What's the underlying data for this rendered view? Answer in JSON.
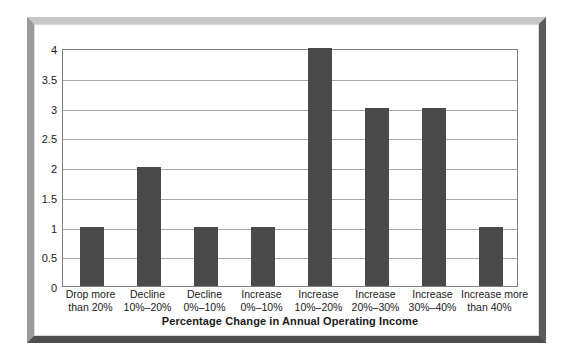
{
  "chart_data": {
    "type": "bar",
    "title": "",
    "xlabel": "Percentage Change in Annual Operating Income",
    "ylabel": "",
    "categories": [
      "Drop more than 20%",
      "Decline 10%–20%",
      "Decline 0%–10%",
      "Increase 0%–10%",
      "Increase 10%–20%",
      "Increase 20%–30%",
      "Increase 30%–40%",
      "Increase more than 40%"
    ],
    "category_lines": [
      [
        "Drop more",
        "than 20%"
      ],
      [
        "Decline",
        "10%–20%"
      ],
      [
        "Decline",
        "0%–10%"
      ],
      [
        "Increase",
        "0%–10%"
      ],
      [
        "Increase",
        "10%–20%"
      ],
      [
        "Increase",
        "20%–30%"
      ],
      [
        "Increase",
        "30%–40%"
      ],
      [
        "Increase more",
        "than 40%"
      ]
    ],
    "values": [
      1,
      2,
      1,
      1,
      4,
      3,
      3,
      1
    ],
    "ylim": [
      0,
      4
    ],
    "ytick_labels": [
      "0",
      "0.5",
      "1",
      "1.5",
      "2",
      "2.5",
      "3",
      "3.5",
      "4"
    ],
    "ytick_values": [
      0,
      0.5,
      1,
      1.5,
      2,
      2.5,
      3,
      3.5,
      4
    ],
    "grid": true,
    "legend": "none",
    "bar_color": "#4a4a4a",
    "gridline_color": "#a9a9a9",
    "plot_border_color": "#808080",
    "background_color": "#ffffff"
  },
  "frame": {
    "border_top_color": "#c8c8c8",
    "border_left_color": "#9b9b9b",
    "border_right_color": "#5b5b5b",
    "border_bottom_color": "#4e4e4e"
  }
}
